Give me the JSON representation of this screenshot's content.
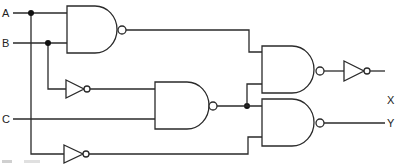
{
  "diagram": {
    "type": "logic-circuit",
    "inputs": [
      {
        "id": "A",
        "label": "A"
      },
      {
        "id": "B",
        "label": "B"
      },
      {
        "id": "C",
        "label": "C"
      }
    ],
    "outputs": [
      {
        "id": "X",
        "label": "X"
      },
      {
        "id": "Y",
        "label": "Y"
      }
    ],
    "gates": [
      {
        "id": "nand1",
        "type": "NAND",
        "inputs": [
          "A",
          "B"
        ]
      },
      {
        "id": "not1",
        "type": "NOT",
        "inputs": [
          "B"
        ]
      },
      {
        "id": "nand2",
        "type": "NAND",
        "inputs": [
          "not1",
          "C"
        ]
      },
      {
        "id": "not2",
        "type": "NOT",
        "inputs": [
          "A"
        ]
      },
      {
        "id": "nand3",
        "type": "NAND",
        "inputs": [
          "nand1",
          "nand2"
        ]
      },
      {
        "id": "nand4",
        "type": "NAND",
        "inputs": [
          "nand2",
          "not2"
        ]
      },
      {
        "id": "not3",
        "type": "NOT",
        "inputs": [
          "nand3"
        ]
      }
    ],
    "output_map": {
      "X": "not3",
      "Y": "nand4"
    },
    "colors": {
      "line": "#2a2a2a",
      "junction": "#111111",
      "background": "#ffffff"
    }
  }
}
